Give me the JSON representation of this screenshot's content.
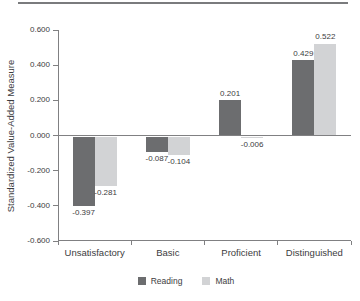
{
  "chart_data": {
    "type": "bar",
    "title": "",
    "xlabel": "",
    "ylabel": "Standardized Value-Added Measure",
    "ylim": [
      -0.6,
      0.6
    ],
    "ytick_step": 0.2,
    "ytick_labels": [
      "0.600",
      "0.400",
      "0.200",
      "0.000",
      "-0.200",
      "-0.400",
      "-0.600"
    ],
    "categories": [
      "Unsatisfactory",
      "Basic",
      "Proficient",
      "Distinguished"
    ],
    "series": [
      {
        "name": "Reading",
        "color": "#6c6d6f",
        "values": [
          -0.397,
          -0.087,
          0.201,
          0.429
        ],
        "value_labels": [
          "-0.397",
          "-0.087",
          "0.201",
          "0.429"
        ]
      },
      {
        "name": "Math",
        "color": "#d2d3d5",
        "values": [
          -0.281,
          -0.104,
          -0.006,
          0.522
        ],
        "value_labels": [
          "-0.281",
          "-0.104",
          "-0.006",
          "0.522"
        ]
      }
    ],
    "legend_position": "bottom",
    "grid": false,
    "zero_line": true
  },
  "colors": {
    "axis": "#808082",
    "text": "#3c3c3e",
    "top_rule": "#7a7b7d",
    "background": "#ffffff"
  }
}
